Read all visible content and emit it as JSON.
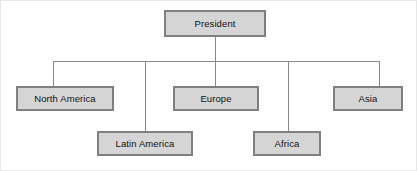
{
  "diagram": {
    "type": "organization-chart",
    "canvas": {
      "width": 417,
      "height": 171
    },
    "colors": {
      "node_fill": "#d5d5d5",
      "node_border": "#808080",
      "connector": "#888888",
      "page_background": "#ffffff",
      "page_border": "#e8e8e8",
      "text": "#111111"
    },
    "root": {
      "id": "president",
      "label": "President",
      "box": {
        "x": 163,
        "y": 9,
        "width": 102,
        "height": 27
      },
      "stem": {
        "x": 214,
        "from_y": 36,
        "to_y": 60
      }
    },
    "bus": {
      "y": 60,
      "x_start": 52,
      "x_end": 378
    },
    "children": [
      {
        "id": "north-america",
        "label": "North America",
        "row": 1,
        "box": {
          "x": 15,
          "y": 85,
          "width": 98,
          "height": 25
        },
        "drop": {
          "x": 52,
          "from_y": 60,
          "to_y": 85
        }
      },
      {
        "id": "latin-america",
        "label": "Latin America",
        "row": 2,
        "box": {
          "x": 96,
          "y": 130,
          "width": 96,
          "height": 25
        },
        "drop": {
          "x": 144,
          "from_y": 60,
          "to_y": 130
        }
      },
      {
        "id": "europe",
        "label": "Europe",
        "row": 1,
        "box": {
          "x": 172,
          "y": 85,
          "width": 86,
          "height": 25
        },
        "drop": {
          "x": 214,
          "from_y": 60,
          "to_y": 85
        }
      },
      {
        "id": "africa",
        "label": "Africa",
        "row": 2,
        "box": {
          "x": 252,
          "y": 130,
          "width": 68,
          "height": 25
        },
        "drop": {
          "x": 287,
          "from_y": 60,
          "to_y": 130
        }
      },
      {
        "id": "asia",
        "label": "Asia",
        "row": 1,
        "box": {
          "x": 332,
          "y": 85,
          "width": 70,
          "height": 25
        },
        "drop": {
          "x": 378,
          "from_y": 60,
          "to_y": 85
        }
      }
    ]
  }
}
